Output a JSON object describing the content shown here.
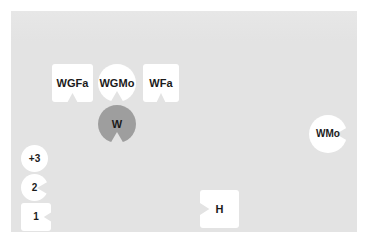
{
  "canvas": {
    "background_color": "#e3e3e3",
    "page_color": "#ffffff"
  },
  "nodes": [
    {
      "id": "wgfa",
      "label": "WGFa",
      "shape": "square-notch-bottom",
      "fill": "#ffffff",
      "text_color": "#1b1b1b",
      "font_size": 11,
      "x": 52,
      "y": 64,
      "w": 41,
      "h": 38
    },
    {
      "id": "wgmo",
      "label": "WGMo",
      "shape": "circle-notch-bottom",
      "fill": "#ffffff",
      "text_color": "#1b1b1b",
      "font_size": 11,
      "x": 98,
      "y": 64,
      "w": 38,
      "h": 38
    },
    {
      "id": "wfa",
      "label": "WFa",
      "shape": "square-notch-bottom",
      "fill": "#ffffff",
      "text_color": "#1b1b1b",
      "font_size": 11,
      "x": 143,
      "y": 64,
      "w": 36,
      "h": 38
    },
    {
      "id": "w",
      "label": "W",
      "shape": "circle-notch-bottom",
      "fill": "#9e9e9e",
      "text_color": "#1b1b1b",
      "font_size": 11,
      "x": 98,
      "y": 105,
      "w": 38,
      "h": 38
    },
    {
      "id": "wmo",
      "label": "WMo",
      "shape": "circle-notch-right",
      "fill": "#ffffff",
      "text_color": "#1b1b1b",
      "font_size": 10,
      "x": 309,
      "y": 115,
      "w": 38,
      "h": 38
    },
    {
      "id": "plus3",
      "label": "+3",
      "shape": "circle",
      "fill": "#ffffff",
      "text_color": "#1b1b1b",
      "font_size": 10,
      "x": 21,
      "y": 145,
      "w": 27,
      "h": 27
    },
    {
      "id": "two",
      "label": "2",
      "shape": "circle-notch-right",
      "fill": "#ffffff",
      "text_color": "#1b1b1b",
      "font_size": 10,
      "x": 21,
      "y": 174,
      "w": 27,
      "h": 27
    },
    {
      "id": "one",
      "label": "1",
      "shape": "square-notch-right",
      "fill": "#ffffff",
      "text_color": "#1b1b1b",
      "font_size": 10,
      "x": 21,
      "y": 203,
      "w": 30,
      "h": 28
    },
    {
      "id": "h",
      "label": "H",
      "shape": "square-notch-left",
      "fill": "#ffffff",
      "text_color": "#1b1b1b",
      "font_size": 11,
      "x": 200,
      "y": 190,
      "w": 39,
      "h": 38
    }
  ]
}
